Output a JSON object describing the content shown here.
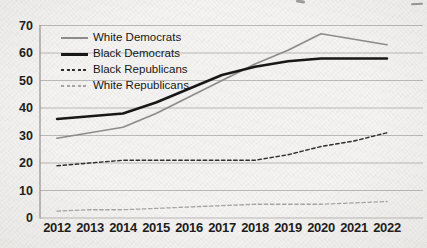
{
  "page": {
    "background_color": "#f4f3f1"
  },
  "chart_data": {
    "type": "line",
    "title": "",
    "xlabel": "",
    "ylabel": "",
    "x": [
      2012,
      2013,
      2014,
      2015,
      2016,
      2017,
      2018,
      2019,
      2020,
      2021,
      2022
    ],
    "ylim": [
      0,
      70
    ],
    "yticks": [
      0,
      10,
      20,
      30,
      40,
      50,
      60,
      70
    ],
    "grid": true,
    "legend_position": "upper-left",
    "grid_color": "#b3b3b3",
    "axis_color": "#8a8a8a",
    "tick_label_color": "#1c1c1c",
    "series": [
      {
        "name": "White Democrats",
        "style": "solid",
        "color": "#8d8d8d",
        "width": 1.7,
        "values": [
          29,
          31,
          33,
          38,
          44,
          50,
          56,
          61,
          67,
          65,
          63
        ]
      },
      {
        "name": "Black Democrats",
        "style": "solid",
        "color": "#171717",
        "width": 2.5,
        "values": [
          36,
          37,
          38,
          42,
          47,
          52,
          55,
          57,
          58,
          58,
          58
        ]
      },
      {
        "name": "Black Republicans",
        "style": "dashed",
        "color": "#2f2f2f",
        "width": 1.4,
        "values": [
          19,
          20,
          21,
          21,
          21,
          21,
          21,
          23,
          26,
          28,
          31
        ]
      },
      {
        "name": "White Republicans",
        "style": "dashed",
        "color": "#a6a6a6",
        "width": 1.3,
        "values": [
          2.5,
          3,
          3,
          3.5,
          4,
          4.5,
          5,
          5,
          5,
          5.5,
          6
        ]
      }
    ]
  }
}
